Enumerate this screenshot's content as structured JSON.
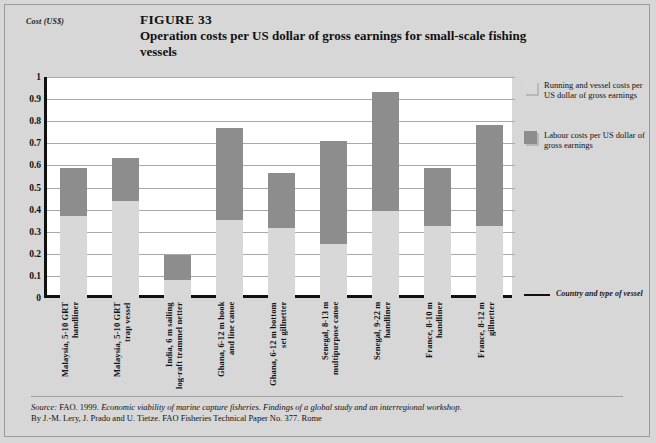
{
  "figure": {
    "number": "FIGURE 33",
    "title": "Operation costs per US dollar of gross earnings for small-scale fishing vessels"
  },
  "axes": {
    "y_title": "Cost (US$)",
    "x_title": "Country and type of vessel"
  },
  "legend": {
    "items": [
      {
        "label": "Running and vessel costs per US dollar of gross earnings",
        "color": "#d8d8d8"
      },
      {
        "label": "Labour costs per US dollar of gross earnings",
        "color": "#8d8d8d"
      }
    ]
  },
  "source": {
    "label": "Source:",
    "line1_a": "FAO. 1999. ",
    "line1_italic": "Economic viability of marine capture fisheries. Findings of a global study and an interregional workshop.",
    "line2": "By J.-M. Lery, J. Prado and U. Tietze. FAO Fisheries Technical Paper No. 377. Rome"
  },
  "chart_data": {
    "type": "bar",
    "title": "Operation costs per US dollar of gross earnings for small-scale fishing vessels",
    "xlabel": "Country and type of vessel",
    "ylabel": "Cost (US$)",
    "ylim": [
      0,
      1
    ],
    "yticks": [
      "0",
      "0.1",
      "0.2",
      "0.3",
      "0.4",
      "0.5",
      "0.6",
      "0.7",
      "0.8",
      "0.9",
      "1"
    ],
    "grid": true,
    "stacked": true,
    "legend_position": "right",
    "categories": [
      "Malaysia, 5-10 GRT\nhandliner",
      "Malaysia, 5-10 GRT\ntrap vessel",
      "India, 6 m sailing\nlog-raft trammel netter",
      "Ghana, 6-12 m hook\nand line canoe",
      "Ghana, 6-12 m bottom\nset gillnetter",
      "Senegal, 8-13 m\nmultipurpose canoe",
      "Senegal, 9-22 m\nhandliner",
      "France, 8-10 m\nhandliner",
      "France, 8-12 m\ngillnetter"
    ],
    "series": [
      {
        "name": "Running and vessel costs per US dollar of gross earnings",
        "color": "#d8d8d8",
        "values": [
          0.37,
          0.44,
          0.08,
          0.355,
          0.315,
          0.245,
          0.395,
          0.325,
          0.325
        ]
      },
      {
        "name": "Labour costs per US dollar of gross earnings",
        "color": "#8d8d8d",
        "values": [
          0.22,
          0.195,
          0.115,
          0.415,
          0.25,
          0.465,
          0.535,
          0.265,
          0.46
        ]
      }
    ],
    "totals": [
      0.59,
      0.635,
      0.195,
      0.77,
      0.565,
      0.71,
      0.93,
      0.59,
      0.785
    ]
  }
}
